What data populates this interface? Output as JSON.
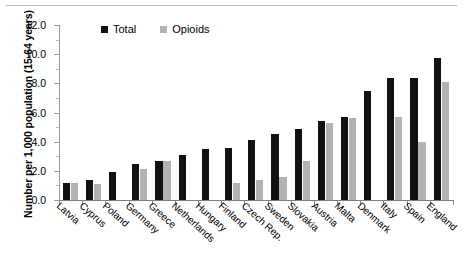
{
  "chart_data": {
    "type": "bar",
    "title": "",
    "subtitle": "",
    "xlabel": "",
    "ylabel": "Number per 1,000 population (15-64 years)",
    "ylim": [
      0.0,
      12.0
    ],
    "ytick_step": 2.0,
    "ytick_labels": [
      "0.0",
      "2.0",
      "4.0",
      "6.0",
      "8.0",
      "10.0",
      "12.0"
    ],
    "grid": false,
    "legend_position": "top-center",
    "categories": [
      "Latvia",
      "Cyprus",
      "Poland",
      "Germany",
      "Greece",
      "Netherlands",
      "Hungary",
      "Finland",
      "Czech Rep.",
      "Sweden",
      "Slovakia",
      "Austria",
      "Malta",
      "Denmark",
      "Italy",
      "Spain",
      "England"
    ],
    "series": [
      {
        "name": "Total",
        "color": "#111111",
        "values": [
          1.2,
          1.4,
          1.9,
          2.5,
          2.7,
          3.1,
          3.5,
          3.6,
          4.1,
          4.5,
          4.9,
          5.4,
          5.7,
          7.5,
          8.4,
          8.4,
          9.75
        ]
      },
      {
        "name": "Opioids",
        "color": "#b2b2b2",
        "values": [
          1.2,
          1.1,
          null,
          2.1,
          2.65,
          null,
          null,
          1.2,
          1.4,
          1.6,
          2.7,
          5.3,
          5.65,
          null,
          5.7,
          4.0,
          8.1
        ]
      }
    ]
  },
  "legend": {
    "items": [
      {
        "label": "Total",
        "swatch": "black-square-marker"
      },
      {
        "label": "Opioids",
        "swatch": "gray-square-marker"
      }
    ]
  }
}
